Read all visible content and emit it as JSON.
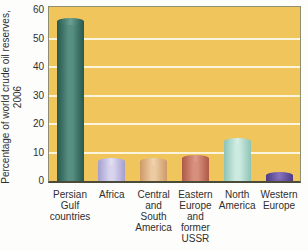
{
  "figure": {
    "background": "#fdfdfb"
  },
  "chart_data": {
    "type": "bar",
    "title": "",
    "xlabel": "",
    "ylabel": "Percentage of world crude oil reserves, 2006",
    "ylabel_lines": [
      "Percentage of world crude oil reserves,",
      "2006"
    ],
    "ylim": [
      0,
      60
    ],
    "yticks": [
      0,
      10,
      20,
      30,
      40,
      50,
      60
    ],
    "grid": {
      "horizontal": true,
      "color": "#fcf7e4",
      "every": 10,
      "vertical": false
    },
    "legend": "none",
    "plot_background": "#f0c65c",
    "frame_color": "#8e8e70",
    "axis_color": "#4b4b38",
    "text_color": "#2f2f2f",
    "categories": [
      "Persian Gulf countries",
      "Africa",
      "Central and South America",
      "Eastern Europe and former USSR",
      "North America",
      "Western Europe"
    ],
    "values": [
      56,
      7,
      7,
      8,
      14,
      2
    ],
    "bars": [
      {
        "label_lines": [
          "Persian",
          "Gulf",
          "countries"
        ],
        "value": 56,
        "edge": "#27584e",
        "mid": "#578e82",
        "cap": "#6aa093"
      },
      {
        "label_lines": [
          "Africa"
        ],
        "value": 7,
        "edge": "#a49ecd",
        "mid": "#d8d4ee",
        "cap": "#e2dff4"
      },
      {
        "label_lines": [
          "Central",
          "and",
          "South",
          "America"
        ],
        "value": 7,
        "edge": "#cd9a66",
        "mid": "#eccaa2",
        "cap": "#f0d4b0"
      },
      {
        "label_lines": [
          "Eastern",
          "Europe",
          "and",
          "former",
          "USSR"
        ],
        "value": 8,
        "edge": "#ad5946",
        "mid": "#d8907e",
        "cap": "#dd9b88"
      },
      {
        "label_lines": [
          "North",
          "America"
        ],
        "value": 14,
        "edge": "#8ec3b5",
        "mid": "#cdeae1",
        "cap": "#d6efe7"
      },
      {
        "label_lines": [
          "Western",
          "Europe"
        ],
        "value": 2,
        "edge": "#4d3b85",
        "mid": "#7a64b2",
        "cap": "#8872bd"
      }
    ]
  }
}
